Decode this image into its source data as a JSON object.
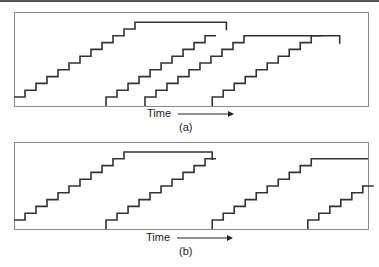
{
  "figure": {
    "panels": [
      {
        "id": "a",
        "caption": "(a)",
        "axis_label": "Time",
        "arrow_direction": "right",
        "staircases": [
          {
            "start_time": 0.0,
            "steps": 11,
            "plateau_until": 0.6,
            "ends_with_drop": true
          },
          {
            "start_time": 0.26,
            "steps": 9,
            "ends_at_top_of": 0
          },
          {
            "start_time": 0.37,
            "steps": 9,
            "plateau_until": 0.92,
            "ends_with_drop": true
          },
          {
            "start_time": 0.56,
            "steps": 9,
            "ends_at_top_of": 2
          }
        ]
      },
      {
        "id": "b",
        "caption": "(b)",
        "axis_label": "Time",
        "arrow_direction": "right",
        "staircases": [
          {
            "start_time": 0.0,
            "steps": 10,
            "plateau_until": 0.56,
            "ends_with_drop": true
          },
          {
            "start_time": 0.26,
            "steps": 9,
            "ends_at_top_of": 0
          },
          {
            "start_time": 0.56,
            "steps": 9,
            "plateau_until": 1.0,
            "ends_with_drop": false
          },
          {
            "start_time": 0.83,
            "steps": 5,
            "ends_at_top_of": null
          }
        ]
      }
    ],
    "colors": {
      "line": "#333333",
      "frame": "#8a8a8a"
    }
  }
}
